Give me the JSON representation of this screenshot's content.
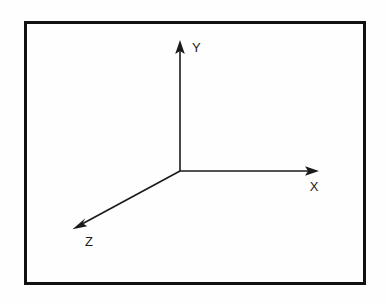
{
  "figure": {
    "canvas": {
      "width": 386,
      "height": 304
    },
    "background_color": "#fefefe",
    "stroke_color": "#1a1a1a",
    "frame": {
      "name": "border-frame",
      "x": 24,
      "y": 21,
      "width": 342,
      "height": 264,
      "thickness": 3,
      "color": "#111111"
    },
    "origin": {
      "x": 180,
      "y": 171
    },
    "axes": [
      {
        "id": "y",
        "label": "Y",
        "label_x": 197,
        "label_y": 52,
        "line": {
          "x1": 180,
          "y1": 171,
          "x2": 180,
          "y2": 47
        },
        "arrow_tip": {
          "x": 180,
          "y": 41
        },
        "direction": "up",
        "stroke_width": 1.6
      },
      {
        "id": "x",
        "label": "X",
        "label_x": 314,
        "label_y": 191,
        "line": {
          "x1": 180,
          "y1": 171,
          "x2": 312,
          "y2": 171
        },
        "arrow_tip": {
          "x": 319,
          "y": 171
        },
        "direction": "right",
        "stroke_width": 1.6
      },
      {
        "id": "z",
        "label": "Z",
        "label_x": 89,
        "label_y": 246,
        "line": {
          "x1": 180,
          "y1": 171,
          "x2": 80,
          "y2": 225
        },
        "arrow_tip": {
          "x": 73,
          "y": 229
        },
        "direction": "down-left",
        "stroke_width": 1.6
      }
    ]
  }
}
